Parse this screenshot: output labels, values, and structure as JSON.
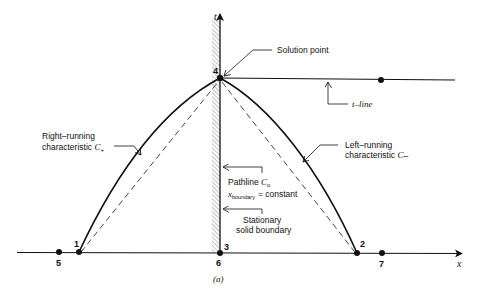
{
  "figure": {
    "caption": "(a)",
    "axes": {
      "x_label": "x",
      "t_label": "t"
    },
    "points": [
      {
        "id": "1",
        "label": "1"
      },
      {
        "id": "2",
        "label": "2"
      },
      {
        "id": "3",
        "label": "3"
      },
      {
        "id": "4",
        "label": "4"
      },
      {
        "id": "5",
        "label": "5"
      },
      {
        "id": "6",
        "label": "6"
      },
      {
        "id": "7",
        "label": "7"
      }
    ],
    "annotations": {
      "solution_point": "Solution point",
      "t_line": "t–line",
      "right_running_1": "Right–running",
      "right_running_2": "characteristic",
      "right_running_sym": "C",
      "right_running_sub": "+",
      "left_running_1": "Left–running",
      "left_running_2": "characteristic",
      "left_running_sym": "C",
      "left_running_sub": "–",
      "pathline": "Pathline",
      "pathline_sym": "C",
      "pathline_sub": "o",
      "x_boundary_sym": "x",
      "x_boundary_sub": "boundary",
      "x_boundary_eq": "= constant",
      "stationary_1": "Stationary",
      "stationary_2": "solid boundary"
    },
    "colors": {
      "ink": "#111111",
      "hatch": "#555555",
      "background": "#ffffff"
    }
  }
}
